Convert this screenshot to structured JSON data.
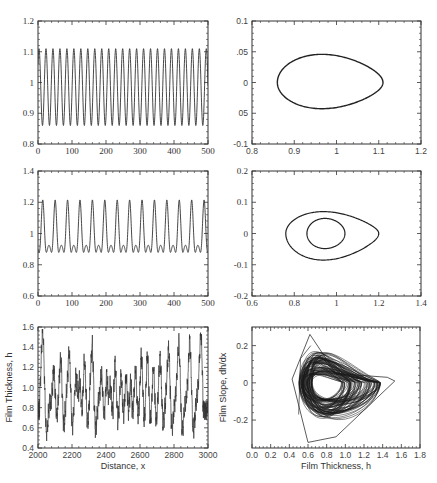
{
  "chart_data": [
    {
      "id": "p1",
      "type": "line",
      "title": "",
      "xlabel": "",
      "ylabel": "",
      "xlim": [
        0,
        500
      ],
      "ylim": [
        0.8,
        1.2
      ],
      "xticks": [
        "0",
        "100",
        "200",
        "300",
        "400",
        "500"
      ],
      "yticks": [
        "0.8",
        "0.9",
        "1",
        "1.1",
        "1.2"
      ],
      "series": [
        {
          "name": "h(x)",
          "description": "periodic oscillation, ~24 cycles",
          "min": 0.86,
          "max": 1.11,
          "period": 20.5
        }
      ],
      "frame": [
        38,
        21,
        208,
        144
      ]
    },
    {
      "id": "p2",
      "type": "line",
      "title": "",
      "xlabel": "",
      "ylabel": "",
      "xlim": [
        0.8,
        1.2
      ],
      "ylim": [
        -0.1,
        0.1
      ],
      "xticks": [
        "0.8",
        "0.9",
        "1",
        "1.1",
        "1.2"
      ],
      "yticks": [
        "-0.1",
        "05",
        "0",
        ".05",
        "0.1"
      ],
      "series": [
        {
          "name": "phase portrait",
          "description": "single closed teardrop loop",
          "hmin": 0.86,
          "hmax": 1.11,
          "slope_min": -0.043,
          "slope_max": 0.04
        }
      ],
      "frame": [
        252,
        21,
        421,
        144
      ]
    },
    {
      "id": "p3",
      "type": "line",
      "title": "",
      "xlabel": "",
      "ylabel": "",
      "xlim": [
        0,
        500
      ],
      "ylim": [
        0.6,
        1.4
      ],
      "xticks": [
        "0",
        "100",
        "200",
        "300",
        "400",
        "500"
      ],
      "yticks": [
        "0.6",
        "0.8",
        "1",
        "1.2",
        "1.4"
      ],
      "series": [
        {
          "name": "h(x)",
          "description": "period-2 oscillation, alternating peaks",
          "min": 0.76,
          "high_peak": 1.2,
          "low_peak": 1.04,
          "inner_min": 0.85,
          "period": 36.5
        }
      ],
      "frame": [
        38,
        171,
        208,
        296
      ]
    },
    {
      "id": "p4",
      "type": "line",
      "title": "",
      "xlabel": "",
      "ylabel": "",
      "xlim": [
        0.6,
        1.4
      ],
      "ylim": [
        -0.2,
        0.2
      ],
      "xticks": [
        "0.6",
        "0.8",
        "1",
        "1.2",
        "1.4"
      ],
      "yticks": [
        "-0.2",
        "-0.1",
        "0",
        "0.1",
        "0.2"
      ],
      "series": [
        {
          "name": "phase portrait",
          "description": "double loop (period-2)",
          "outer": {
            "hmin": 0.76,
            "hmax": 1.2,
            "smin": -0.085,
            "smax": 0.07
          },
          "inner": {
            "hmin": 0.86,
            "hmax": 1.04,
            "smin": -0.045,
            "smax": 0.045
          }
        }
      ],
      "frame": [
        252,
        171,
        421,
        296
      ]
    },
    {
      "id": "p5",
      "type": "line",
      "title": "",
      "xlabel": "Distance, x",
      "ylabel": "Film Thickness, h",
      "xlim": [
        2000,
        3000
      ],
      "ylim": [
        0.4,
        1.6
      ],
      "xticks": [
        "2000",
        "2200",
        "2400",
        "2600",
        "2800",
        "3000"
      ],
      "yticks": [
        "0.4",
        "0.6",
        "0.8",
        "1.0",
        "1.2",
        "1.4",
        "1.6"
      ],
      "series": [
        {
          "name": "h(x)",
          "description": "chaotic train of solitary pulses",
          "peaks_x": [
            2030,
            2095,
            2135,
            2185,
            2225,
            2245,
            2275,
            2320,
            2375,
            2405,
            2425,
            2455,
            2490,
            2520,
            2545,
            2575,
            2610,
            2645,
            2680,
            2720,
            2770,
            2830,
            2895,
            2960
          ],
          "peaks_h": [
            1.57,
            1.19,
            1.31,
            1.36,
            1.11,
            1.2,
            1.31,
            1.43,
            1.15,
            1.12,
            1.16,
            1.25,
            1.13,
            1.12,
            1.09,
            1.19,
            1.32,
            1.33,
            1.22,
            1.29,
            1.4,
            1.46,
            1.47,
            1.56
          ],
          "troughs_h_min": 0.48
        }
      ],
      "frame": [
        38,
        327,
        208,
        448
      ]
    },
    {
      "id": "p6",
      "type": "line",
      "title": "",
      "xlabel": "Film Thickness, h",
      "ylabel": "Film Slope, dh/dx",
      "xlim": [
        0.0,
        1.8
      ],
      "ylim": [
        -0.35,
        0.3
      ],
      "xticks": [
        "0.0",
        "0.2",
        "0.4",
        "0.6",
        "0.8",
        "1.0",
        "1.2",
        "1.4",
        "1.6",
        "1.8"
      ],
      "yticks": [
        "-0.2",
        "0",
        "0.2"
      ],
      "series": [
        {
          "name": "phase portrait",
          "description": "chaotic attractor, dense tangle of loops",
          "hmin": 0.43,
          "hmax": 1.53,
          "smin": -0.32,
          "smax": 0.26
        }
      ],
      "frame": [
        252,
        327,
        420,
        448
      ]
    }
  ]
}
